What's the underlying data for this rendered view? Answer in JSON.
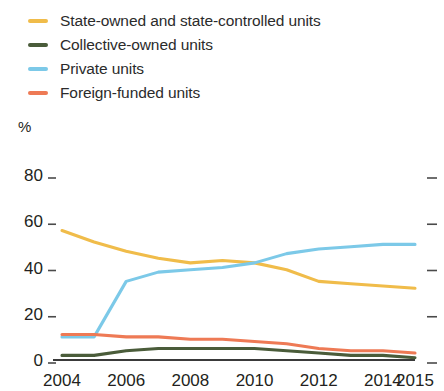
{
  "chart_data": {
    "type": "line",
    "title": "",
    "subtitle": "",
    "xlabel": "",
    "ylabel": "%",
    "y_unit": "%",
    "x": [
      2004,
      2005,
      2006,
      2007,
      2008,
      2009,
      2010,
      2011,
      2012,
      2013,
      2014,
      2015
    ],
    "xlim": [
      2004,
      2015
    ],
    "ylim": [
      0,
      80
    ],
    "xticks": [
      2004,
      2006,
      2008,
      2010,
      2012,
      2014,
      2015
    ],
    "xtick_labels": [
      "2004",
      "2006",
      "2008",
      "2010",
      "2012",
      "2014",
      "2015"
    ],
    "yticks": [
      0,
      20,
      40,
      60,
      80
    ],
    "ytick_labels": [
      "0",
      "20",
      "40",
      "60",
      "80"
    ],
    "grid": false,
    "legend_position": "top-left",
    "series": [
      {
        "name": "State-owned and state-controlled units",
        "color": "#f0bc4a",
        "values": [
          56,
          51,
          47,
          44,
          42,
          43,
          42,
          39,
          34,
          33,
          32,
          31
        ]
      },
      {
        "name": "Collective-owned units",
        "color": "#4a5c3a",
        "values": [
          2,
          2,
          4,
          5,
          5,
          5,
          5,
          4,
          3,
          2,
          2,
          1
        ]
      },
      {
        "name": "Private units",
        "color": "#7cc9e8",
        "values": [
          10,
          10,
          34,
          38,
          39,
          40,
          42,
          46,
          48,
          49,
          50,
          50
        ]
      },
      {
        "name": "Foreign-funded units",
        "color": "#ee7a55",
        "values": [
          11,
          11,
          10,
          10,
          9,
          9,
          8,
          7,
          5,
          4,
          4,
          3
        ]
      }
    ]
  },
  "legend": {
    "items": [
      {
        "label": "State-owned and state-controlled units",
        "color": "#f0bc4a"
      },
      {
        "label": "Collective-owned units",
        "color": "#4a5c3a"
      },
      {
        "label": "Private units",
        "color": "#7cc9e8"
      },
      {
        "label": "Foreign-funded units",
        "color": "#ee7a55"
      }
    ]
  }
}
